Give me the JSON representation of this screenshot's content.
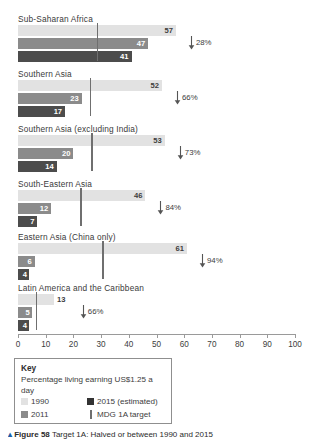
{
  "chart_data": {
    "type": "bar",
    "orientation": "horizontal",
    "title": "",
    "xlabel": "",
    "ylabel": "",
    "xlim": [
      0,
      100
    ],
    "xticks": [
      0,
      10,
      20,
      30,
      40,
      50,
      60,
      70,
      80,
      90,
      100
    ],
    "grid": false,
    "legend_position": "below-axis-left",
    "categories": [
      "Sub-Saharan Africa",
      "Southern Asia",
      "Southern Asia (excluding India)",
      "South-Eastern Asia",
      "Eastern Asia (China only)",
      "Latin America and the Caribbean"
    ],
    "series": [
      {
        "name": "1990",
        "color": "#e2e2e2",
        "values": [
          57,
          52,
          53,
          46,
          61,
          13
        ]
      },
      {
        "name": "2011",
        "color": "#8b8b8b",
        "values": [
          47,
          23,
          20,
          12,
          6,
          5
        ]
      },
      {
        "name": "2015 (estimated)",
        "color": "#4c4c4c",
        "values": [
          41,
          17,
          14,
          7,
          4,
          4
        ]
      }
    ],
    "mdg_target": {
      "name": "MDG 1A target",
      "color": "#6f6f6f",
      "values": [
        28.5,
        26.0,
        26.5,
        22.5,
        30.5,
        6.5
      ]
    },
    "reduction_labels": [
      "28%",
      "66%",
      "73%",
      "84%",
      "94%",
      "66%"
    ]
  },
  "groups": [
    {
      "label": "Sub-Saharan Africa",
      "values": {
        "y1990": 57,
        "y2011": 47,
        "y2015": 41
      },
      "value_labels": {
        "y1990": "57",
        "y2011": "47",
        "y2015": "41"
      },
      "mdg": 28.5,
      "delta": "28%"
    },
    {
      "label": "Southern Asia",
      "values": {
        "y1990": 52,
        "y2011": 23,
        "y2015": 17
      },
      "value_labels": {
        "y1990": "52",
        "y2011": "23",
        "y2015": "17"
      },
      "mdg": 26.0,
      "delta": "66%"
    },
    {
      "label": "Southern Asia (excluding India)",
      "values": {
        "y1990": 53,
        "y2011": 20,
        "y2015": 14
      },
      "value_labels": {
        "y1990": "53",
        "y2011": "20",
        "y2015": "14"
      },
      "mdg": 26.5,
      "delta": "73%"
    },
    {
      "label": "South-Eastern Asia",
      "values": {
        "y1990": 46,
        "y2011": 12,
        "y2015": 7
      },
      "value_labels": {
        "y1990": "46",
        "y2011": "12",
        "y2015": "7"
      },
      "mdg": 22.5,
      "delta": "84%"
    },
    {
      "label": "Eastern Asia (China only)",
      "values": {
        "y1990": 61,
        "y2011": 6,
        "y2015": 4
      },
      "value_labels": {
        "y1990": "61",
        "y2011": "6",
        "y2015": "4"
      },
      "mdg": 30.5,
      "delta": "94%"
    },
    {
      "label": "Latin America and the Caribbean",
      "values": {
        "y1990": 13,
        "y2011": 5,
        "y2015": 4
      },
      "value_labels": {
        "y1990": "13",
        "y2011": "5",
        "y2015": "4"
      },
      "mdg": 6.5,
      "delta": "66%"
    }
  ],
  "axis": {
    "ticks": [
      "0",
      "10",
      "20",
      "30",
      "40",
      "50",
      "60",
      "70",
      "80",
      "90",
      "100"
    ]
  },
  "legend": {
    "title": "Key",
    "subtitle": "Percentage living earning US$1.25 a day",
    "entries": [
      {
        "label": "1990",
        "swatch": "s1990"
      },
      {
        "label": "2015 (estimated)",
        "swatch": "s2015"
      },
      {
        "label": "2011",
        "swatch": "s2011"
      },
      {
        "label": "MDG 1A target",
        "swatch": "line"
      }
    ]
  },
  "caption": {
    "marker": "▴",
    "figure": "Figure 58",
    "text": "Target 1A: Halved or between 1990 and 2015"
  },
  "colors": {
    "series_1990": "#e2e2e2",
    "series_2011": "#8b8b8b",
    "series_2015": "#4c4c4c",
    "mdg_line": "#6f6f6f",
    "axis": "#9a9a9a",
    "text": "#3d3d3d"
  }
}
